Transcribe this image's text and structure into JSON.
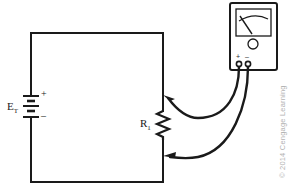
{
  "figure": {
    "background_color": "#ffffff",
    "line_color": "#1a1a1a",
    "copyright": "© 2014 Cengage Learning"
  },
  "circuit": {
    "source": {
      "label": "E",
      "label_subscript": "T",
      "plus_sign": "+",
      "minus_sign": "–",
      "symbol": "battery-multicell"
    },
    "resistor": {
      "label": "R",
      "label_subscript": "1",
      "symbol": "resistor-zigzag"
    }
  },
  "meter": {
    "name": "analog-voltmeter",
    "terminals": {
      "positive": "+",
      "negative": "–"
    },
    "scale": "arc-scale",
    "needle": "pointer-needle",
    "knob": "adjust-knob"
  },
  "leads": {
    "count": 2,
    "upper": "test-lead-upper",
    "lower": "test-lead-lower",
    "arrow_direction": "left"
  }
}
